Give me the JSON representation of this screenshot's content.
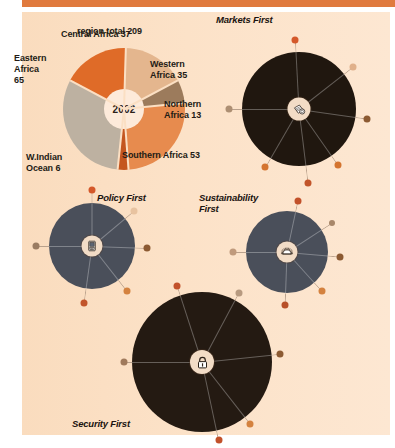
{
  "page": {
    "background_color": "#fbdfc3",
    "outer_background_color": "#ffffff",
    "top_rule_color": "#e07a3e"
  },
  "pie_chart": {
    "center_label": "2002",
    "header_label": "region total",
    "header_value": "209"
  },
  "labels": {
    "region_total": "region total 209",
    "central_africa": "Central Africa 37",
    "eastern_africa": "Eastern\nAfrica\n65",
    "western_africa": "Western\nAfrica 35",
    "northern_africa": "Northern\nAfrica 13",
    "southern_africa": "Southern Africa 53",
    "w_indian_ocean": "W.Indian\nOcean 6"
  },
  "scenarios": [
    {
      "id": "markets-first",
      "title": "Markets First",
      "icon": "money-icon",
      "disc_color": "#20170f",
      "hub_color": "#f2dcc6"
    },
    {
      "id": "policy-first",
      "title": "Policy First",
      "icon": "computer-icon",
      "disc_color": "#4a4f5a",
      "hub_color": "#f2dcc6"
    },
    {
      "id": "sustainability-first",
      "title": "Sustainability\nFirst",
      "icon": "sun-icon",
      "disc_color": "#4a4f5a",
      "hub_color": "#f2dcc6"
    },
    {
      "id": "security-first",
      "title": "Security First",
      "icon": "padlock-icon",
      "disc_color": "#241a12",
      "hub_color": "#f2dcc6"
    }
  ],
  "chart_data": {
    "type": "pie",
    "title": "region total 209",
    "center_label": "2002",
    "total": 209,
    "unit": "",
    "categories": [
      "Central Africa",
      "Western Africa",
      "Northern Africa",
      "Southern Africa",
      "W.Indian Ocean",
      "Eastern Africa"
    ],
    "values": [
      37,
      35,
      13,
      53,
      6,
      65
    ],
    "colors": [
      "#df6b28",
      "#e4b68e",
      "#9c7b5c",
      "#e78b4e",
      "#c4561f",
      "#bdb1a1"
    ],
    "legend": "labels placed around pie",
    "grid": false,
    "secondary_charts": [
      {
        "type": "radial-dot",
        "name": "Markets First",
        "icon": "money-icon",
        "spokes": 6,
        "dot_colors": [
          "#d4582a",
          "#e0b08a",
          "#ad8f73",
          "#8c5a32",
          "#d4742f",
          "#c2552a"
        ]
      },
      {
        "type": "radial-dot",
        "name": "Policy First",
        "icon": "computer-icon",
        "spokes": 6,
        "dot_colors": [
          "#d4582a",
          "#e8c3a0",
          "#9a7c62",
          "#8c5a32",
          "#d4823f",
          "#c2552a"
        ]
      },
      {
        "type": "radial-dot",
        "name": "Sustainability First",
        "icon": "sun-icon",
        "spokes": 6,
        "dot_colors": [
          "#c2512a",
          "#a8876a",
          "#c09a7c",
          "#8c5a32",
          "#d4823f",
          "#b84f28"
        ]
      },
      {
        "type": "radial-dot",
        "name": "Security First",
        "icon": "padlock-icon",
        "spokes": 6,
        "dot_colors": [
          "#c2512a",
          "#b79a80",
          "#a07a5c",
          "#8c5a32",
          "#d4823f",
          "#b84f28"
        ]
      }
    ]
  }
}
